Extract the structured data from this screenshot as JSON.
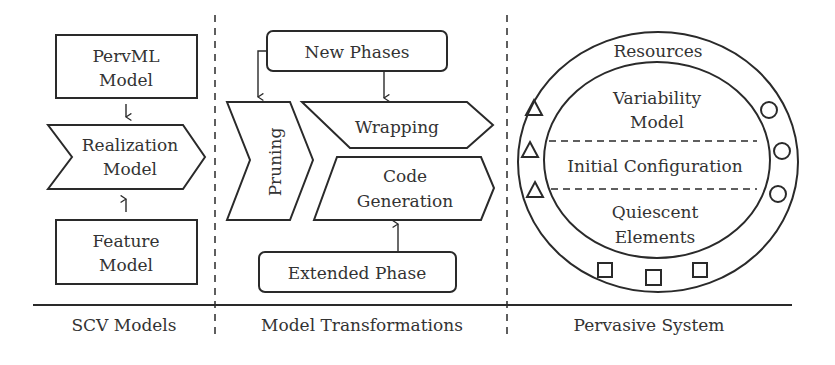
{
  "sections": {
    "scv_models": {
      "caption": "SCV Models",
      "pervml_model": {
        "line1": "PervML",
        "line2": "Model"
      },
      "realization_model": {
        "line1": "Realization",
        "line2": "Model"
      },
      "feature_model": {
        "line1": "Feature",
        "line2": "Model"
      }
    },
    "model_transformations": {
      "caption": "Model Transformations",
      "new_phases": "New Phases",
      "pruning": "Pruning",
      "wrapping": "Wrapping",
      "code_generation": {
        "line1": "Code",
        "line2": "Generation"
      },
      "extended_phase": "Extended Phase"
    },
    "pervasive_system": {
      "caption": "Pervasive System",
      "resources": "Resources",
      "variability_model": {
        "line1": "Variability",
        "line2": "Model"
      },
      "initial_configuration": "Initial Configuration",
      "quiescent_elements": {
        "line1": "Quiescent",
        "line2": "Elements"
      },
      "resource_markers": {
        "triangles": 3,
        "circles": 3,
        "squares": 3
      }
    }
  },
  "colors": {
    "stroke": "#2a2a2a",
    "text": "#333333",
    "background": "#ffffff"
  }
}
